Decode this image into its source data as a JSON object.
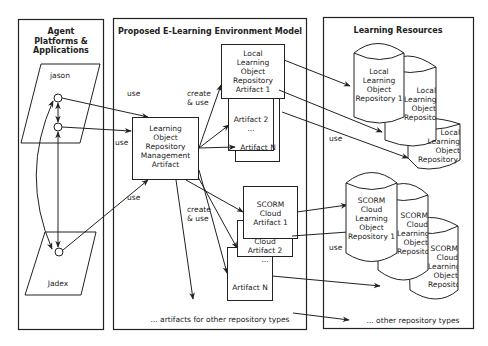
{
  "panels": {
    "agents": {
      "title": "Agent\nPlatforms &\nApplications",
      "title_lines": [
        "Agent",
        "Platforms &",
        "Applications"
      ]
    },
    "model": {
      "title": "Proposed E-Learning Environment Model"
    },
    "resources": {
      "title": "Learning Resources"
    }
  },
  "platforms": [
    {
      "name": "jason"
    },
    {
      "name": "Jadex"
    }
  ],
  "artifacts": {
    "management": {
      "lines": [
        "Learning",
        "Object",
        "Repository",
        "Management",
        "Artifact"
      ]
    },
    "local": [
      {
        "lines": [
          "Local",
          "Learning",
          "Object",
          "Repository",
          "Artifact 1"
        ]
      },
      {
        "lines": [
          "Artifact 2",
          "..."
        ]
      },
      {
        "lines": [
          "Artifact N"
        ]
      }
    ],
    "scorm": [
      {
        "lines": [
          "SCORM",
          "Cloud",
          "Artifact 1"
        ]
      },
      {
        "lines": [
          "Cloud",
          "Artifact 2",
          "..."
        ]
      },
      {
        "lines": [
          "Artifact N"
        ]
      }
    ],
    "other": "... artifacts for other repository types"
  },
  "repositories": {
    "local": [
      {
        "lines": [
          "Local",
          "Learning",
          "Object",
          "Repository 1"
        ]
      },
      {
        "lines": [
          "Local",
          "Learning",
          "Object",
          "Repository 2",
          "..."
        ]
      },
      {
        "lines": [
          "Local",
          "Learning",
          "Object",
          "Repository N"
        ]
      }
    ],
    "scorm": [
      {
        "lines": [
          "SCORM",
          "Cloud",
          "Learning",
          "Object",
          "Repository 1"
        ]
      },
      {
        "lines": [
          "SCORM",
          "Cloud",
          "Learning",
          "Object",
          "Repository 2",
          "..."
        ]
      },
      {
        "lines": [
          "SCORM",
          "Cloud",
          "Learning",
          "Object",
          "Repository N"
        ]
      }
    ],
    "other": "... other repository types"
  },
  "edge_labels": {
    "use_top": "use",
    "use_mid": "use",
    "use_bottom": "use",
    "create_use_top": [
      "create",
      "& use"
    ],
    "create_use_bottom": [
      "create",
      "& use"
    ],
    "use_local_repos": "use",
    "use_scorm_repos": "use"
  },
  "colors": {
    "stroke": "#222222",
    "background": "#ffffff",
    "text": "#222222"
  }
}
